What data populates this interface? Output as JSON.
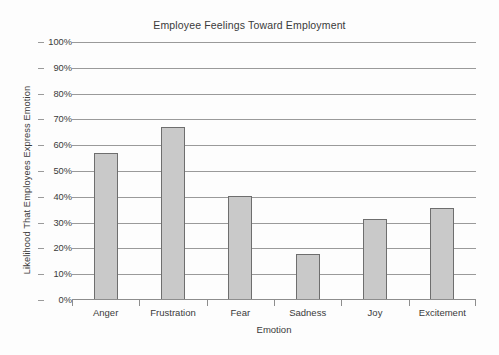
{
  "chart_data": {
    "type": "bar",
    "title": "Employee Feelings Toward Employment",
    "xlabel": "Emotion",
    "ylabel": "Likelihood That Employees Express Emotion",
    "categories": [
      "Anger",
      "Frustration",
      "Fear",
      "Sadness",
      "Joy",
      "Excitement"
    ],
    "values": [
      57,
      67,
      40.5,
      18,
      31.5,
      35.5
    ],
    "value_labels": [
      "57%",
      "67%",
      "40.5%",
      "18%",
      "31.5%",
      "35.5%"
    ],
    "ylim": [
      0,
      100
    ],
    "y_ticks": [
      0,
      10,
      20,
      30,
      40,
      50,
      60,
      70,
      80,
      90,
      100
    ],
    "y_tick_labels": [
      "0%",
      "10%",
      "20%",
      "30%",
      "40%",
      "50%",
      "60%",
      "70%",
      "80%",
      "90%",
      "100%"
    ],
    "grid": true,
    "legend": false,
    "legend_position": "none",
    "bar_color": "#c9c9c9",
    "bar_border_color": "#6e6e6e",
    "gridline_color": "#9a9a9a",
    "axis_color": "#8d8d8d",
    "text_color": "#3a3a3a",
    "background_color": "#fdfdfd"
  }
}
